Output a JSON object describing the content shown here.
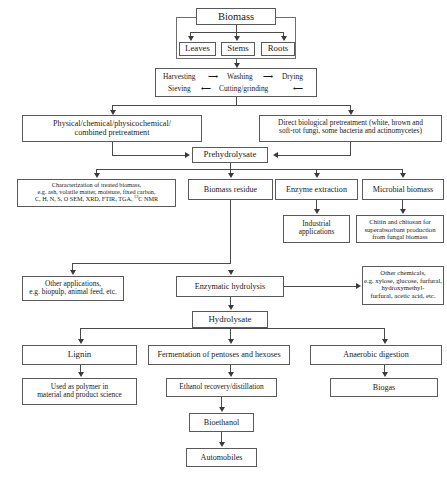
{
  "diagram": {
    "nodes": {
      "biomass": "Biomass",
      "leaves": "Leaves",
      "stems": "Stems",
      "roots": "Roots",
      "harvesting": "Harvesting",
      "washing": "Washing",
      "drying": "Drying",
      "sieving": "Sieving",
      "cutting_grinding": "Cutting/grinding",
      "physical_pretreatment_l1": "Physical/chemical/physicochemical/",
      "physical_pretreatment_l2": "combined pretreatment",
      "biological_pretreatment_l1": "Direct biological pretreatment (white, brown and",
      "biological_pretreatment_l2": "soft-rot fungi, some bacteria and actinomycetes)",
      "prehydrolysate": "Prehydrolysate",
      "characterization_l1": "Characterization of treated biomass,",
      "characterization_l2": "e.g. ash, volatile matter, moisture, fixed carbon,",
      "characterization_l3a": "C, H, N, S, O SEM, XRD, FTIR, TGA, ",
      "characterization_l3sup": "13",
      "characterization_l3b": "C NMR",
      "biomass_residue": "Biomass residue",
      "enzyme_extraction": "Enzyme extraction",
      "microbial_biomass": "Microbial biomass",
      "industrial_applications_l1": "Industrial",
      "industrial_applications_l2": "applications",
      "chitin_l1": "Chitin and chitosan for",
      "chitin_l2": "superabsorbant production",
      "chitin_l3": "from fungal biomass",
      "other_applications_l1": "Other applications,",
      "other_applications_l2": "e.g. biopulp, animal feed, etc.",
      "enzymatic_hydrolysis": "Enzymatic hydrolysis",
      "other_chemicals_l1": "Other chemicals,",
      "other_chemicals_l2": "e.g. xylose, glucose, furfural,",
      "other_chemicals_l3": "hydroxymethyl-",
      "other_chemicals_l4": "furfural, acetic acid, etc.",
      "hydrolysate": "Hydrolysate",
      "lignin": "Lignin",
      "fermentation": "Fermentation of pentoses and hexoses",
      "anaerobic_digestion": "Anaerobic digestion",
      "polymer_l1": "Used as polymer in",
      "polymer_l2": "material and product science",
      "ethanol_recovery": "Ethanol recovery/distillation",
      "biogas": "Biogas",
      "bioethanol": "Bioethanol",
      "automobiles": "Automobiles"
    },
    "colors": {
      "border": "#5a5a5a",
      "line": "#4a4a4a",
      "arrow": "#3a3a3a",
      "background": "#ffffff",
      "text": "#1a1a1a"
    }
  }
}
